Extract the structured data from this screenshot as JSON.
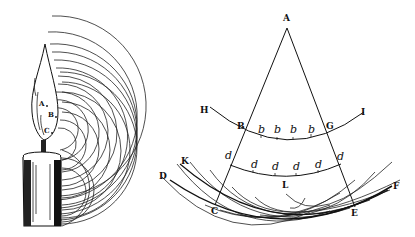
{
  "figure_left": {
    "title": "Candle flame emitting concentric wavefronts",
    "labels": [
      "A",
      "B",
      "C"
    ]
  },
  "figure_right": {
    "title": "Huygens wavefront construction",
    "apex_label": "A",
    "upper_arc": {
      "left_end": "H",
      "right_end": "I",
      "left_intersection": "B",
      "right_intersection": "G",
      "points": [
        "b",
        "b",
        "b",
        "b"
      ]
    },
    "middle_arc": {
      "left_mark": "d",
      "right_mark": "d",
      "points": [
        "d",
        "d",
        "d",
        "d"
      ]
    },
    "lower_arc": {
      "left_end": "D",
      "right_end": "F",
      "inner_left": "K",
      "left_intersection": "C",
      "right_intersection": "E",
      "center_label": "L"
    }
  }
}
